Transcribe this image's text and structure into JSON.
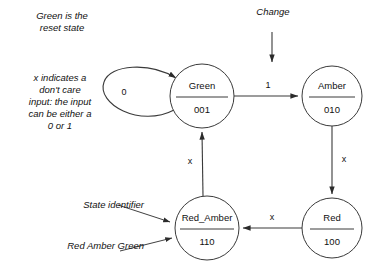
{
  "diagram": {
    "background_color": "#ffffff",
    "line_color": "#3a3a3a",
    "text_color": "#111111"
  },
  "annotations": {
    "reset_note": "Green is the\nreset state",
    "dont_care_note": "x indicates a\ndon't care\ninput: the input\ncan be either a\n0 or 1",
    "state_identifier_label": "State identifier",
    "rag_label": "Red Amber Green",
    "change_label": "Change"
  },
  "states": [
    {
      "id": "green",
      "name": "Green",
      "code": "001",
      "cx": 202,
      "cy": 96,
      "r": 32
    },
    {
      "id": "amber",
      "name": "Amber",
      "code": "010",
      "cx": 332,
      "cy": 96,
      "r": 30
    },
    {
      "id": "red",
      "name": "Red",
      "code": "100",
      "cx": 332,
      "cy": 228,
      "r": 30
    },
    {
      "id": "red_amber",
      "name": "Red_Amber",
      "code": "110",
      "cx": 207,
      "cy": 228,
      "r": 32
    }
  ],
  "transitions": [
    {
      "id": "green-self",
      "from": "green",
      "to": "green",
      "label": "0"
    },
    {
      "id": "green-amber",
      "from": "green",
      "to": "amber",
      "label": "1"
    },
    {
      "id": "amber-red",
      "from": "amber",
      "to": "red",
      "label": "x"
    },
    {
      "id": "red-redamber",
      "from": "red",
      "to": "red_amber",
      "label": "x"
    },
    {
      "id": "redamber-green",
      "from": "red_amber",
      "to": "green",
      "label": "x"
    }
  ],
  "inputs": [
    {
      "id": "change-input",
      "label": "Change",
      "target": "amber"
    }
  ]
}
